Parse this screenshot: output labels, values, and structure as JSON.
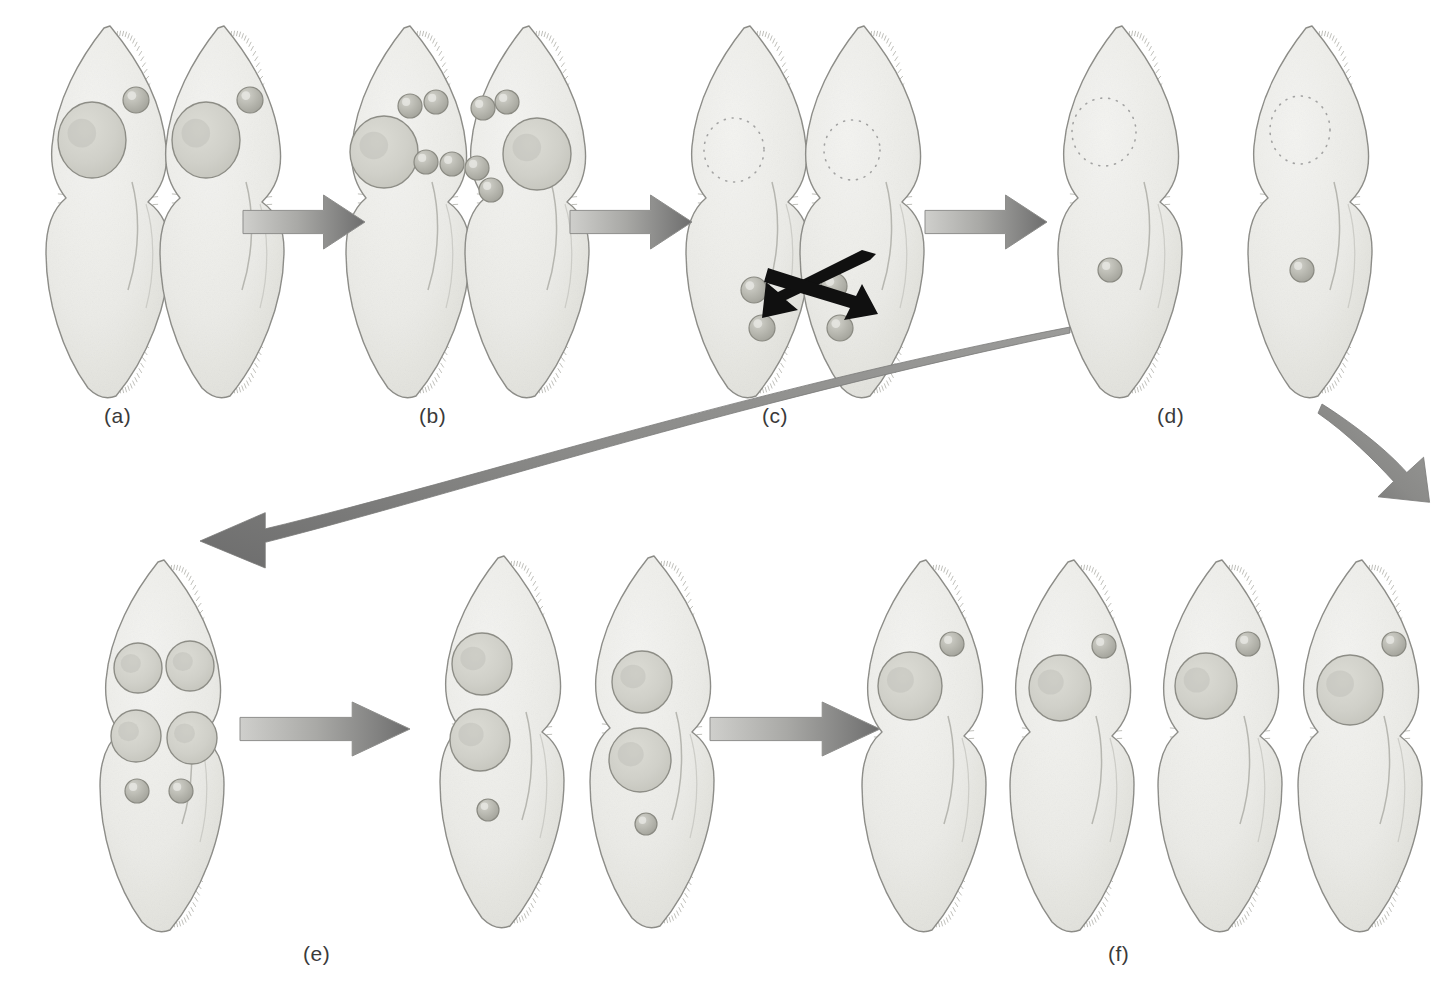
{
  "figure": {
    "background_color": "#ffffff",
    "width": 1444,
    "height": 994
  },
  "palette": {
    "cell_body_fill": "#ededea",
    "cell_body_fill_dark": "#e2e2dd",
    "cell_outline": "#8a8a85",
    "macronucleus_fill": "#d2d2cb",
    "macronucleus_outline": "#8d8d86",
    "micronucleus_fill": "#b9b9b1",
    "micronucleus_outline": "#8a8a82",
    "arrow_light": "#c9c9c6",
    "arrow_dark": "#6e6e6e",
    "curve_arrow": "#7d7d7d",
    "exchange_arrow": "#101010",
    "label_text": "#3a3a3a",
    "dotted_nucleus": "#909090"
  },
  "stage_labels": [
    {
      "id": "a",
      "text": "(a)",
      "x": 104,
      "y": 404
    },
    {
      "id": "b",
      "text": "(b)",
      "x": 419,
      "y": 404
    },
    {
      "id": "c",
      "text": "(c)",
      "x": 762,
      "y": 404
    },
    {
      "id": "d",
      "text": "(d)",
      "x": 1157,
      "y": 404
    },
    {
      "id": "e",
      "text": "(e)",
      "x": 303,
      "y": 942
    },
    {
      "id": "f",
      "text": "(f)",
      "x": 1108,
      "y": 942
    }
  ],
  "stages": [
    {
      "id": "a",
      "label": "(a)",
      "description": "Two compatible mating-type Paramecium cells pair and attach at their oral grooves",
      "cell_count": 2,
      "macronuclei_per_cell": 1,
      "micronuclei_per_cell": 1,
      "macronucleus_state": "intact",
      "cells": [
        {
          "x": 36,
          "y": 22,
          "flip": false,
          "macronuclei": [
            {
              "cx": 56,
              "cy": 118,
              "rx": 34,
              "ry": 38
            }
          ],
          "micronuclei": [
            {
              "cx": 100,
              "cy": 78,
              "r": 13
            }
          ],
          "dotted_macronuclei": []
        },
        {
          "x": 150,
          "y": 22,
          "flip": false,
          "macronuclei": [
            {
              "cx": 56,
              "cy": 118,
              "rx": 34,
              "ry": 38
            }
          ],
          "micronuclei": [
            {
              "cx": 100,
              "cy": 78,
              "r": 13
            }
          ],
          "dotted_macronuclei": []
        }
      ]
    },
    {
      "id": "b",
      "label": "(b)",
      "description": "Micronucleus of each cell undergoes meiosis producing four haploid micronuclei",
      "cell_count": 2,
      "macronuclei_per_cell": 1,
      "micronuclei_per_cell": 4,
      "macronucleus_state": "intact",
      "cells": [
        {
          "x": 336,
          "y": 22,
          "flip": false,
          "macronuclei": [
            {
              "cx": 48,
              "cy": 130,
              "rx": 34,
              "ry": 36
            }
          ],
          "micronuclei": [
            {
              "cx": 74,
              "cy": 84,
              "r": 12
            },
            {
              "cx": 100,
              "cy": 80,
              "r": 12
            },
            {
              "cx": 90,
              "cy": 140,
              "r": 12
            },
            {
              "cx": 116,
              "cy": 142,
              "r": 12
            }
          ],
          "dotted_macronuclei": []
        },
        {
          "x": 455,
          "y": 22,
          "flip": false,
          "macronuclei": [
            {
              "cx": 82,
              "cy": 132,
              "rx": 34,
              "ry": 36
            }
          ],
          "micronuclei": [
            {
              "cx": 28,
              "cy": 86,
              "r": 12
            },
            {
              "cx": 52,
              "cy": 80,
              "r": 12
            },
            {
              "cx": 22,
              "cy": 146,
              "r": 12
            },
            {
              "cx": 36,
              "cy": 168,
              "r": 12
            }
          ],
          "dotted_macronuclei": []
        }
      ]
    },
    {
      "id": "c",
      "label": "(c)",
      "description": "Macronuclei disintegrate; three micronuclei degenerate and the remaining micronucleus divides; haploid micronuclei are exchanged between partners",
      "cell_count": 2,
      "macronuclei_per_cell": 0,
      "micronuclei_per_cell": 2,
      "macronucleus_state": "disintegrating",
      "has_exchange_arrows": true,
      "cells": [
        {
          "x": 676,
          "y": 22,
          "flip": false,
          "macronuclei": [],
          "micronuclei": [
            {
              "cx": 78,
              "cy": 268,
              "r": 13
            },
            {
              "cx": 86,
              "cy": 306,
              "r": 13
            }
          ],
          "dotted_macronuclei": [
            {
              "cx": 58,
              "cy": 128,
              "rx": 30,
              "ry": 32
            }
          ]
        },
        {
          "x": 790,
          "y": 22,
          "flip": false,
          "macronuclei": [],
          "micronuclei": [
            {
              "cx": 44,
              "cy": 264,
              "r": 13
            },
            {
              "cx": 50,
              "cy": 306,
              "r": 13
            }
          ],
          "dotted_macronuclei": [
            {
              "cx": 62,
              "cy": 128,
              "rx": 28,
              "ry": 30
            }
          ]
        }
      ]
    },
    {
      "id": "d",
      "label": "(d)",
      "description": "Cells separate; the exchanged and resident micronuclei fuse forming a diploid zygote nucleus; old macronucleus still disintegrating",
      "cell_count": 2,
      "macronuclei_per_cell": 0,
      "micronuclei_per_cell": 1,
      "macronucleus_state": "disintegrating",
      "cells": [
        {
          "x": 1048,
          "y": 22,
          "flip": false,
          "macronuclei": [],
          "micronuclei": [
            {
              "cx": 62,
              "cy": 248,
              "r": 12
            }
          ],
          "dotted_macronuclei": [
            {
              "cx": 56,
              "cy": 110,
              "rx": 32,
              "ry": 34
            }
          ]
        },
        {
          "x": 1238,
          "y": 22,
          "flip": false,
          "macronuclei": [],
          "micronuclei": [
            {
              "cx": 64,
              "cy": 248,
              "r": 12
            }
          ],
          "dotted_macronuclei": [
            {
              "cx": 62,
              "cy": 108,
              "rx": 30,
              "ry": 34
            }
          ]
        }
      ]
    },
    {
      "id": "e",
      "label": "(e)",
      "description": "Zygote nucleus divides repeatedly producing four macronuclei and two micronuclei",
      "cell_count": 1,
      "macronuclei_per_cell": 4,
      "micronuclei_per_cell": 2,
      "macronucleus_state": "intact",
      "cells": [
        {
          "x": 90,
          "y": 556,
          "flip": false,
          "macronuclei": [
            {
              "cx": 48,
              "cy": 112,
              "rx": 24,
              "ry": 25
            },
            {
              "cx": 100,
              "cy": 110,
              "rx": 24,
              "ry": 25
            },
            {
              "cx": 46,
              "cy": 180,
              "rx": 25,
              "ry": 26
            },
            {
              "cx": 102,
              "cy": 182,
              "rx": 25,
              "ry": 26
            }
          ],
          "micronuclei": [
            {
              "cx": 47,
              "cy": 235,
              "r": 12
            },
            {
              "cx": 91,
              "cy": 235,
              "r": 12
            }
          ],
          "dotted_macronuclei": []
        }
      ]
    },
    {
      "id": "e2",
      "label": "",
      "description": "First cell division: two daughter cells each receive two macronuclei and one micronucleus",
      "cell_count": 2,
      "macronuclei_per_cell": 2,
      "micronuclei_per_cell": 1,
      "macronucleus_state": "intact",
      "cells": [
        {
          "x": 430,
          "y": 552,
          "flip": false,
          "macronuclei": [
            {
              "cx": 52,
              "cy": 112,
              "rx": 30,
              "ry": 31
            },
            {
              "cx": 50,
              "cy": 188,
              "rx": 30,
              "ry": 31
            }
          ],
          "micronuclei": [
            {
              "cx": 58,
              "cy": 258,
              "r": 11
            }
          ],
          "dotted_macronuclei": []
        },
        {
          "x": 580,
          "y": 552,
          "flip": false,
          "macronuclei": [
            {
              "cx": 62,
              "cy": 130,
              "rx": 30,
              "ry": 31
            },
            {
              "cx": 60,
              "cy": 208,
              "rx": 31,
              "ry": 32
            }
          ],
          "micronuclei": [
            {
              "cx": 66,
              "cy": 272,
              "r": 11
            }
          ],
          "dotted_macronuclei": []
        }
      ]
    },
    {
      "id": "f",
      "label": "(f)",
      "description": "Second cell division yields four daughter cells, each with one macronucleus and one micronucleus",
      "cell_count": 4,
      "macronuclei_per_cell": 1,
      "micronuclei_per_cell": 1,
      "macronucleus_state": "intact",
      "cells": [
        {
          "x": 852,
          "y": 556,
          "flip": false,
          "macronuclei": [
            {
              "cx": 58,
              "cy": 130,
              "rx": 32,
              "ry": 34
            }
          ],
          "micronuclei": [
            {
              "cx": 100,
              "cy": 88,
              "r": 12
            }
          ],
          "dotted_macronuclei": []
        },
        {
          "x": 1000,
          "y": 556,
          "flip": false,
          "macronuclei": [
            {
              "cx": 60,
              "cy": 132,
              "rx": 31,
              "ry": 33
            }
          ],
          "micronuclei": [
            {
              "cx": 104,
              "cy": 90,
              "r": 12
            }
          ],
          "dotted_macronuclei": []
        },
        {
          "x": 1148,
          "y": 556,
          "flip": false,
          "macronuclei": [
            {
              "cx": 58,
              "cy": 130,
              "rx": 31,
              "ry": 33
            }
          ],
          "micronuclei": [
            {
              "cx": 100,
              "cy": 88,
              "r": 12
            }
          ],
          "dotted_macronuclei": []
        },
        {
          "x": 1288,
          "y": 556,
          "flip": false,
          "macronuclei": [
            {
              "cx": 62,
              "cy": 134,
              "rx": 33,
              "ry": 35
            }
          ],
          "micronuclei": [
            {
              "cx": 106,
              "cy": 88,
              "r": 12
            }
          ],
          "dotted_macronuclei": []
        }
      ]
    }
  ],
  "arrows": [
    {
      "id": "a-to-b",
      "type": "straight",
      "direction": "right",
      "x": 243,
      "y": 193,
      "width": 122,
      "height": 58
    },
    {
      "id": "b-to-c",
      "type": "straight",
      "direction": "right",
      "x": 570,
      "y": 193,
      "width": 122,
      "height": 58
    },
    {
      "id": "c-to-d",
      "type": "straight",
      "direction": "right",
      "x": 925,
      "y": 193,
      "width": 122,
      "height": 58
    },
    {
      "id": "e-to-e2",
      "type": "straight",
      "direction": "right",
      "x": 240,
      "y": 700,
      "width": 170,
      "height": 58
    },
    {
      "id": "e2-to-f",
      "type": "straight",
      "direction": "right",
      "x": 710,
      "y": 700,
      "width": 170,
      "height": 58
    },
    {
      "id": "d-down-right",
      "type": "curved-short",
      "direction": "down-right",
      "x": 1318,
      "y": 400,
      "width": 120,
      "height": 110
    },
    {
      "id": "d-to-e-sweep",
      "type": "curved-long",
      "direction": "left",
      "x": 200,
      "y": 325,
      "width": 870,
      "height": 270
    }
  ],
  "exchange_arrows": {
    "id": "micronuclei-exchange",
    "x": 758,
    "y": 248,
    "width": 124,
    "height": 76,
    "count": 2,
    "color": "#101010",
    "description": "Crossed black arrows indicating reciprocal exchange of haploid micronuclei between conjugating partners"
  }
}
